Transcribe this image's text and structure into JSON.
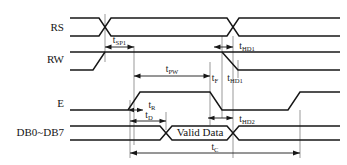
{
  "diagram": {
    "type": "timing-diagram",
    "title": "",
    "signals": [
      {
        "id": "rs",
        "label": "RS",
        "row_y": 28
      },
      {
        "id": "rw",
        "label": "RW",
        "row_y": 60
      },
      {
        "id": "e",
        "label": "E",
        "row_y": 104
      },
      {
        "id": "db",
        "label": "DB0~DB7",
        "row_y": 133
      }
    ],
    "data_bus_value": "Valid Data",
    "timings": [
      {
        "id": "tsp1",
        "base": "t",
        "sub": "SP1",
        "text": "tSP1",
        "from_x": 105,
        "to_x": 134,
        "y": 43
      },
      {
        "id": "thd1a",
        "base": "t",
        "sub": "HD1",
        "text": "tHD1",
        "from_x": 216,
        "to_x": 233,
        "y": 43
      },
      {
        "id": "tpw",
        "base": "t",
        "sub": "PW",
        "text": "tPW",
        "from_x": 134,
        "to_x": 210,
        "y": 72
      },
      {
        "id": "tf",
        "base": "t",
        "sub": "F",
        "text": "tF",
        "from_x": 210,
        "to_x": 222,
        "y": 72
      },
      {
        "id": "thd1b",
        "base": "t",
        "sub": "HD1",
        "text": "tHD1",
        "from_x": 222,
        "to_x": 238,
        "y": 72
      },
      {
        "id": "tr",
        "base": "t",
        "sub": "R",
        "text": "tR",
        "from_x": 130,
        "to_x": 142,
        "y": 110
      },
      {
        "id": "td",
        "base": "t",
        "sub": "D",
        "text": "tD",
        "from_x": 130,
        "to_x": 166,
        "y": 120
      },
      {
        "id": "thd2",
        "base": "t",
        "sub": "HD2",
        "text": "tHD2",
        "from_x": 210,
        "to_x": 233,
        "y": 120
      },
      {
        "id": "tc",
        "base": "t",
        "sub": "C",
        "text": "tC",
        "from_x": 130,
        "to_x": 300,
        "y": 153
      }
    ],
    "axis": {
      "x_start": 70,
      "x_end": 340
    },
    "colors": {
      "stroke": "#171717",
      "guide": "#555555",
      "background": "#ffffff",
      "text": "#151515"
    }
  }
}
